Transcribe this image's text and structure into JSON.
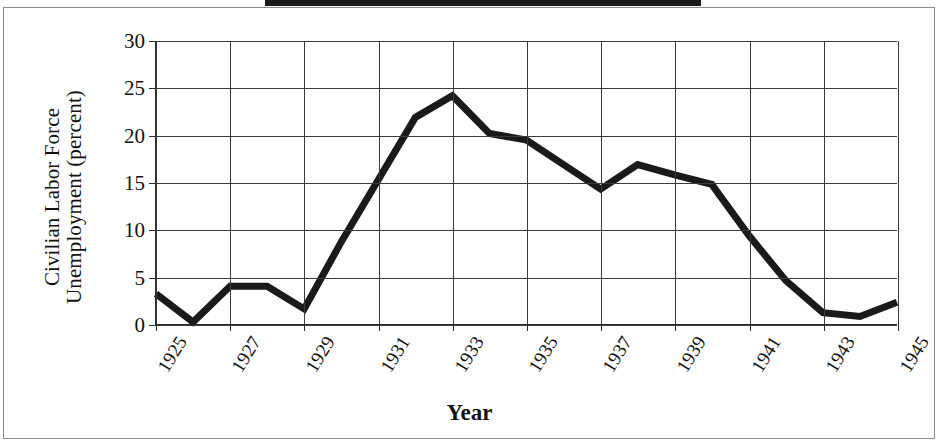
{
  "figure": {
    "top_band_color": "#1b1b1b",
    "frame_color": "#8d8d8d",
    "line_color": "#1a1a1a",
    "grid_color": "#3a3a3a"
  },
  "chart_data": {
    "type": "line",
    "title": "",
    "xlabel": "Year",
    "ylabel": "Civilian Labor Force Unemployment (percent)",
    "ylabel_line1": "Civilian Labor Force",
    "ylabel_line2": "Unemployment (percent)",
    "xlim": [
      1925,
      1945
    ],
    "ylim": [
      0,
      30
    ],
    "grid": true,
    "legend": "none",
    "y_ticks": [
      0,
      5,
      10,
      15,
      20,
      25,
      30
    ],
    "y_tick_labels": [
      "0",
      "5",
      "10",
      "15",
      "20",
      "25",
      "30"
    ],
    "x_ticks": [
      1925,
      1927,
      1929,
      1931,
      1933,
      1935,
      1937,
      1939,
      1941,
      1943,
      1945
    ],
    "x_tick_labels": [
      "1925",
      "1927",
      "1929",
      "1931",
      "1933",
      "1935",
      "1937",
      "1939",
      "1941",
      "1943",
      "1945"
    ],
    "x": [
      1925,
      1926,
      1927,
      1928,
      1929,
      1930,
      1931,
      1932,
      1933,
      1934,
      1935,
      1936,
      1937,
      1938,
      1939,
      1940,
      1941,
      1942,
      1943,
      1944,
      1945
    ],
    "values": [
      3.2,
      0.2,
      4.0,
      4.0,
      1.6,
      8.7,
      15.3,
      21.9,
      24.2,
      20.2,
      19.5,
      16.9,
      14.3,
      16.9,
      15.8,
      14.8,
      9.4,
      4.6,
      1.2,
      0.8,
      2.3
    ],
    "series": [
      {
        "name": "Civilian Labor Force Unemployment",
        "values": [
          3.2,
          0.2,
          4.0,
          4.0,
          1.6,
          8.7,
          15.3,
          21.9,
          24.2,
          20.2,
          19.5,
          16.9,
          14.3,
          16.9,
          15.8,
          14.8,
          9.4,
          4.6,
          1.2,
          0.8,
          2.3
        ]
      }
    ]
  }
}
